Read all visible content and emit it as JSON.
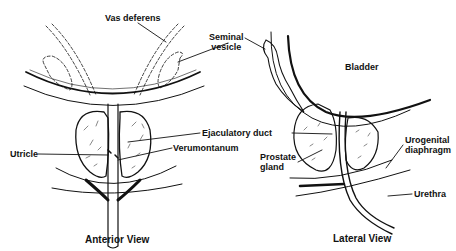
{
  "diagram": {
    "views": [
      {
        "id": "anterior",
        "title": "Anterior View"
      },
      {
        "id": "lateral",
        "title": "Lateral View"
      }
    ],
    "labels": {
      "vas_deferens": "Vas deferens",
      "seminal_vesicle_line1": "Seminal",
      "seminal_vesicle_line2": "vesicle",
      "bladder": "Bladder",
      "ejaculatory_duct": "Ejaculatory duct",
      "utricle": "Utricle",
      "verumontanum": "Verumontanum",
      "prostate_gland_line1": "Prostate",
      "prostate_gland_line2": "gland",
      "urogenital_diaphragm_line1": "Urogenital",
      "urogenital_diaphragm_line2": "diaphragm",
      "urethra": "Urethra"
    },
    "colors": {
      "ink": "#111111",
      "background": "#ffffff"
    }
  }
}
